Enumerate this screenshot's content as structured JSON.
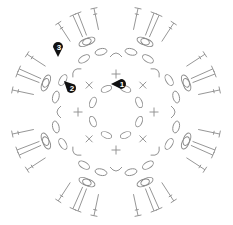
{
  "diagram": {
    "type": "crochet-chart",
    "center": [
      116,
      112
    ],
    "stroke_color": "#8a8a8a",
    "marker_color": "#111111",
    "rounds": [
      {
        "round": 1,
        "stitch": "chain",
        "symbol": "oval",
        "count": 8,
        "radius": 25
      },
      {
        "round": 2,
        "stitch": "single-crochet",
        "symbols": [
          "+",
          "×"
        ],
        "count": 8,
        "radius": 38
      },
      {
        "round": 3,
        "stitch": "chain-arc",
        "symbol": "arc",
        "count": 8,
        "radius": 55
      },
      {
        "round": 3,
        "stitch": "chain",
        "symbol": "oval",
        "count": 16,
        "radius": 62
      },
      {
        "round": 3,
        "stitch": "chain",
        "symbol": "oval",
        "count": 16,
        "radius": 75
      },
      {
        "round": 3,
        "stitch": "double-crochet",
        "symbol": "T",
        "count": 32,
        "radius_inner": 82,
        "radius_outer": 108
      }
    ],
    "markers": [
      {
        "label": "1",
        "x": 121,
        "y": 84,
        "direction": "left"
      },
      {
        "label": "2",
        "x": 71,
        "y": 88,
        "direction": "up-left"
      },
      {
        "label": "3",
        "x": 58,
        "y": 47,
        "direction": "down"
      }
    ]
  }
}
